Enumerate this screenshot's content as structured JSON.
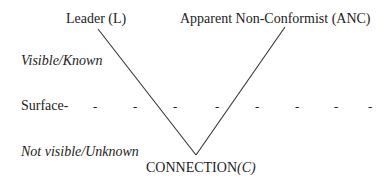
{
  "diagram": {
    "top_labels": {
      "leader": "Leader (L)",
      "anc": "Apparent Non-Conformist (ANC)"
    },
    "zones": {
      "visible": "Visible/Known",
      "surface": "Surface-",
      "not_visible": "Not visible/Unknown"
    },
    "bottom": {
      "connection": "CONNECTION",
      "connection_symbol": "(C)"
    },
    "surface_dashes": [
      "-",
      "-",
      "-",
      "-",
      "-",
      "-",
      "-",
      "-"
    ],
    "line_color": "#333333"
  }
}
